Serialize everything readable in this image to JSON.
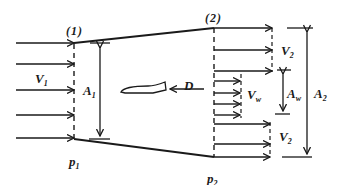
{
  "diagram": {
    "colors": {
      "stroke": "#1a1a1a",
      "background": "#ffffff"
    },
    "sections": [
      {
        "id": "1",
        "label": "(1)"
      },
      {
        "id": "2",
        "label": "(2)"
      }
    ],
    "labels": {
      "V1": {
        "main": "V",
        "sub": "1"
      },
      "A1": {
        "main": "A",
        "sub": "1"
      },
      "p1": {
        "main": "p",
        "sub": "1"
      },
      "p2": {
        "main": "p",
        "sub": "2"
      },
      "V2_top": {
        "main": "V",
        "sub": "2"
      },
      "V2_bottom": {
        "main": "V",
        "sub": "2"
      },
      "Vw": {
        "main": "V",
        "sub": "w"
      },
      "Aw": {
        "main": "A",
        "sub": "w"
      },
      "A2": {
        "main": "A",
        "sub": "2"
      },
      "D": "D"
    },
    "icons": {
      "body": "streamlined-body-shape",
      "drag": "left-arrow"
    }
  }
}
